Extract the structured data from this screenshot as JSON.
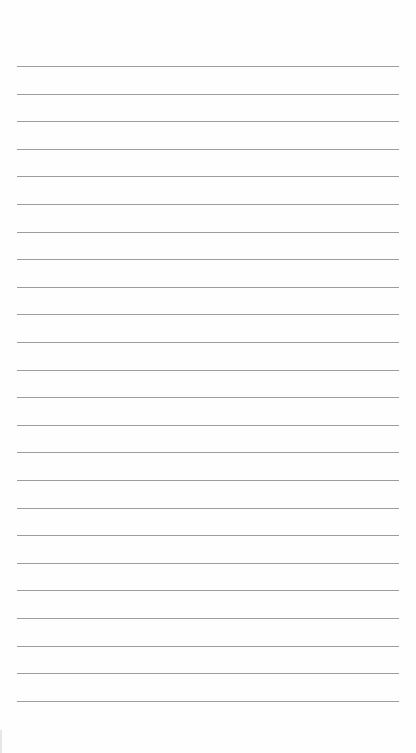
{
  "page": {
    "type": "lined-notepad",
    "background_color": "#fefefe",
    "rule_color": "#8c8c8c",
    "rule_count": 24,
    "first_rule_y": 66,
    "rule_spacing": 27.6,
    "rule_left": 17,
    "rule_width": 382,
    "lines": [
      "",
      "",
      "",
      "",
      "",
      "",
      "",
      "",
      "",
      "",
      "",
      "",
      "",
      "",
      "",
      "",
      "",
      "",
      "",
      "",
      "",
      "",
      "",
      ""
    ]
  }
}
